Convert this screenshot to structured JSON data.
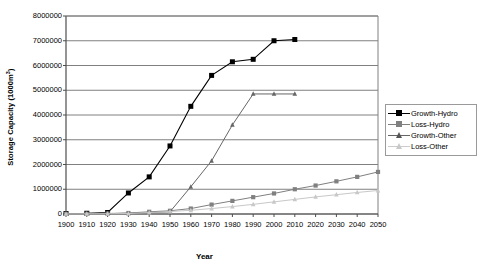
{
  "chart_data": {
    "type": "line",
    "title": "",
    "xlabel": "Year",
    "ylabel": "Storage Capacity (1000m³)",
    "ylabel_base": "Storage Capacity (1000m",
    "ylabel_sup": "3",
    "ylabel_close": ")",
    "xlim": [
      1900,
      2050
    ],
    "ylim": [
      0,
      8000000
    ],
    "grid": "horizontal",
    "legend_position": "right",
    "categories": [
      1900,
      1910,
      1920,
      1930,
      1940,
      1950,
      1960,
      1970,
      1980,
      1990,
      2000,
      2010,
      2020,
      2030,
      2040,
      2050
    ],
    "xticklabels": [
      "1900",
      "1910",
      "1920",
      "1930",
      "1940",
      "1950",
      "1960",
      "1970",
      "1980",
      "1990",
      "2000",
      "2010",
      "2020",
      "2030",
      "2040",
      "2050"
    ],
    "yticks": [
      0,
      1000000,
      2000000,
      3000000,
      4000000,
      5000000,
      6000000,
      7000000,
      8000000
    ],
    "yticklabels": [
      "0",
      "1000000",
      "2000000",
      "3000000",
      "4000000",
      "5000000",
      "6000000",
      "7000000",
      "8000000"
    ],
    "series": [
      {
        "name": "Growth-Hydro",
        "marker": "square-filled",
        "color": "#000000",
        "x": [
          1900,
          1910,
          1920,
          1930,
          1940,
          1950,
          1960,
          1970,
          1980,
          1990,
          2000,
          2010
        ],
        "values": [
          20000,
          30000,
          60000,
          850000,
          1500000,
          2750000,
          4350000,
          5600000,
          6150000,
          6250000,
          7000000,
          7050000
        ]
      },
      {
        "name": "Loss-Hydro",
        "marker": "square-filled",
        "color": "#808080",
        "x": [
          1900,
          1910,
          1920,
          1930,
          1940,
          1950,
          1960,
          1970,
          1980,
          1990,
          2000,
          2010,
          2020,
          2030,
          2040,
          2050
        ],
        "values": [
          5000,
          10000,
          20000,
          40000,
          90000,
          130000,
          220000,
          380000,
          530000,
          680000,
          830000,
          1000000,
          1150000,
          1320000,
          1500000,
          1700000
        ]
      },
      {
        "name": "Growth-Other",
        "marker": "triangle-filled",
        "color": "#666666",
        "x": [
          1900,
          1910,
          1920,
          1930,
          1940,
          1950,
          1960,
          1970,
          1980,
          1990,
          2000,
          2010
        ],
        "values": [
          5000,
          8000,
          15000,
          30000,
          60000,
          90000,
          1100000,
          2150000,
          3600000,
          4850000,
          4850000,
          4850000
        ]
      },
      {
        "name": "Loss-Other",
        "marker": "triangle-filled",
        "color": "#c8c8c8",
        "x": [
          1900,
          1910,
          1920,
          1930,
          1940,
          1950,
          1960,
          1970,
          1980,
          1990,
          2000,
          2010,
          2020,
          2030,
          2040,
          2050
        ],
        "values": [
          3000,
          5000,
          10000,
          20000,
          60000,
          100000,
          150000,
          220000,
          300000,
          390000,
          490000,
          590000,
          690000,
          780000,
          870000,
          950000
        ]
      }
    ]
  },
  "legend": {
    "items": [
      {
        "label": "Growth-Hydro"
      },
      {
        "label": "Loss-Hydro"
      },
      {
        "label": "Growth-Other"
      },
      {
        "label": "Loss-Other"
      }
    ]
  }
}
